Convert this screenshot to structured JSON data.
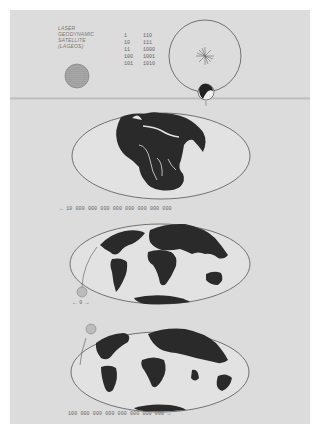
{
  "plaque": {
    "title_lines": [
      "LASER",
      "GEODYNAMIC",
      "SATELLITE",
      "(LAGEOS)"
    ],
    "binary_numbers": {
      "column1": [
        "1",
        "10",
        "11",
        "100",
        "101"
      ],
      "column2": [
        "110",
        "111",
        "1000",
        "1001",
        "1010"
      ]
    },
    "orbit_marker": "1",
    "maps": [
      {
        "name": "past-continents",
        "caption": "← 10 000 000 000 000 000 000 000 000"
      },
      {
        "name": "present-continents",
        "caption": "← 0 →"
      },
      {
        "name": "future-continents",
        "caption": "100 000 000 000 000 000 000 000 →"
      }
    ]
  },
  "colors": {
    "background": "#ffffff",
    "plaque": "#dcdcdc",
    "ink": "#2a2a2a",
    "line": "#555555",
    "text": "#777777"
  }
}
